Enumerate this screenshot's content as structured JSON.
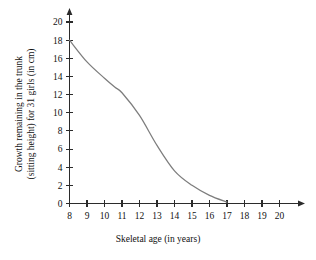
{
  "chart_data": {
    "type": "line",
    "title": "",
    "xlabel": "Skeletal age (in years)",
    "ylabel_line1": "Growth remaining in the trunk",
    "ylabel_line2": "(sitting height) for 31 girls (in cm)",
    "ylabel": "Growth remaining in the trunk (sitting height) for 31 girls (in cm)",
    "xlim": [
      8,
      20
    ],
    "ylim": [
      0,
      20
    ],
    "xticks": [
      8,
      9,
      10,
      11,
      12,
      13,
      14,
      15,
      16,
      17,
      18,
      19,
      20
    ],
    "yticks": [
      0,
      2,
      4,
      6,
      8,
      10,
      12,
      14,
      16,
      18,
      20
    ],
    "grid": false,
    "legend": false,
    "series": [
      {
        "name": "Growth remaining",
        "color": "#7d7d7d",
        "x": [
          8,
          9,
          10,
          10.6,
          11,
          12,
          13,
          14,
          15,
          16,
          17
        ],
        "values": [
          18.0,
          15.6,
          13.8,
          12.8,
          12.2,
          9.7,
          6.4,
          3.6,
          2.0,
          0.9,
          0.15
        ]
      }
    ],
    "annotations": []
  },
  "axis_style": {
    "axis_color": "#2b2b2b",
    "curve_color": "#7d7d7d",
    "background": "#ffffff"
  }
}
